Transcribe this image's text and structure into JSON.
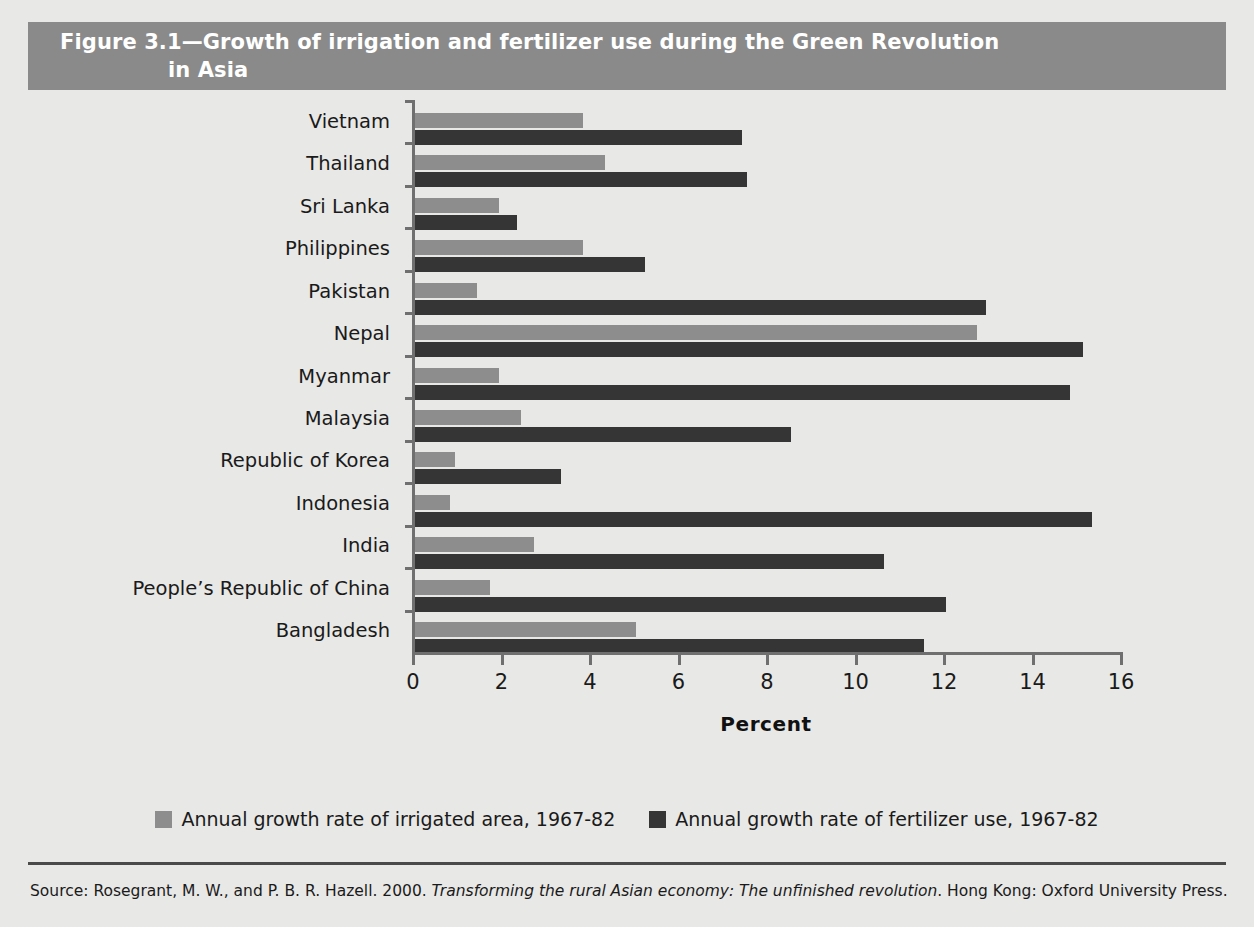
{
  "figure": {
    "title_line1": "Figure 3.1—Growth of irrigation and fertilizer use during the Green Revolution",
    "title_line2": "in Asia",
    "title_band_color": "#8a8a8a",
    "background_color": "#e8e8e6"
  },
  "source": {
    "prefix": "Source: Rosegrant, M. W., and P. B. R. Hazell. 2000. ",
    "italic_title": "Transforming the rural Asian economy: The unfinished revolution",
    "suffix": ". Hong Kong:",
    "line2": "Oxford University Press."
  },
  "legend": {
    "position": "bottom-center",
    "entries": [
      {
        "label": "Annual growth rate of irrigated area, 1967-82",
        "color": "#8d8d8d",
        "key": "irrigated"
      },
      {
        "label": "Annual growth rate of fertilizer use, 1967-82",
        "color": "#353535",
        "key": "fertilizer"
      }
    ]
  },
  "chart_data": {
    "type": "bar",
    "orientation": "horizontal",
    "title": "Figure 3.1—Growth of irrigation and fertilizer use during the Green Revolution in Asia",
    "xlabel": "Percent",
    "ylabel": "",
    "xlim": [
      0,
      16
    ],
    "xticks": [
      0,
      2,
      4,
      6,
      8,
      10,
      12,
      14,
      16
    ],
    "xticklabels": [
      "0",
      "2",
      "4",
      "6",
      "8",
      "10",
      "12",
      "14",
      "16"
    ],
    "grid": false,
    "legend_position": "bottom",
    "categories": [
      "Vietnam",
      "Thailand",
      "Sri Lanka",
      "Philippines",
      "Pakistan",
      "Nepal",
      "Myanmar",
      "Malaysia",
      "Republic of Korea",
      "Indonesia",
      "India",
      "People’s Republic of China",
      "Bangladesh"
    ],
    "series": [
      {
        "name": "Annual growth rate of irrigated area, 1967-82",
        "color": "#8d8d8d",
        "values": [
          3.8,
          4.3,
          1.9,
          3.8,
          1.4,
          12.7,
          1.9,
          2.4,
          0.9,
          0.8,
          2.7,
          1.7,
          5.0
        ]
      },
      {
        "name": "Annual growth rate of fertilizer use, 1967-82",
        "color": "#353535",
        "values": [
          7.4,
          7.5,
          2.3,
          5.2,
          12.9,
          15.1,
          14.8,
          8.5,
          3.3,
          15.3,
          10.6,
          12.0,
          11.5
        ]
      }
    ]
  }
}
